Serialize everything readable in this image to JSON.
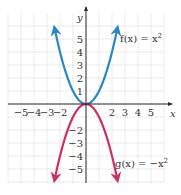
{
  "chart_data": {
    "type": "line",
    "title": "",
    "xlabel": "x",
    "ylabel": "y",
    "xlim": [
      -6,
      6
    ],
    "ylim": [
      -6,
      7
    ],
    "grid": true,
    "x_ticks": [
      -5,
      -4,
      -3,
      -2,
      2,
      3,
      4,
      5
    ],
    "x_tick_labels": [
      "−5",
      "−4",
      "−3",
      "−2",
      "2",
      "3",
      "4",
      "5"
    ],
    "y_ticks": [
      5,
      4,
      3,
      2,
      1,
      -2,
      -3,
      -4,
      -5
    ],
    "y_tick_labels": [
      "5",
      "4",
      "3",
      "2",
      "1",
      "−2",
      "−3",
      "−4",
      "−5"
    ],
    "series": [
      {
        "name": "f(x) = x^2",
        "label_parts": [
          "f(x) = x",
          "2"
        ],
        "expression": "x^2",
        "color": "#2b86c5",
        "domain": [
          -2.4,
          2.4
        ],
        "arrows": "both-ends"
      },
      {
        "name": "g(x) = -x^2",
        "label_parts": [
          "g(x) = −x",
          "2"
        ],
        "expression": "-x^2",
        "color": "#cc2f66",
        "domain": [
          -2.4,
          2.4
        ],
        "arrows": "both-ends"
      }
    ],
    "annotations": [
      {
        "text": "f(x) = x^2",
        "near": "upper-right"
      },
      {
        "text": "g(x) = -x^2",
        "near": "lower-right"
      }
    ]
  }
}
